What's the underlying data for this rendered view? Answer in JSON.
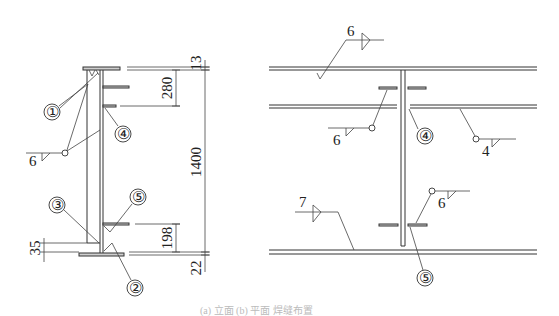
{
  "figure": {
    "caption": "(a) 立面 (b) 平面 焊缝布置",
    "left_view": {
      "name": "section",
      "dimensions": {
        "top_flange": "13",
        "top_stiffener_spacing": "280",
        "web_height": "1400",
        "bottom_stiffener_spacing": "198",
        "bottom_flange": "22",
        "bottom_gap": "35"
      },
      "callouts": [
        "①",
        "②",
        "③",
        "④",
        "⑤"
      ],
      "weld_symbol": {
        "size": "6"
      }
    },
    "right_view": {
      "name": "plan",
      "callouts": [
        "④",
        "⑤"
      ],
      "weld_symbols": [
        {
          "size": "6",
          "type": "fillet-both"
        },
        {
          "size": "6",
          "type": "fillet"
        },
        {
          "size": "4",
          "type": "fillet"
        },
        {
          "size": "6",
          "type": "fillet"
        },
        {
          "size": "7",
          "type": "fillet-both"
        }
      ]
    }
  }
}
